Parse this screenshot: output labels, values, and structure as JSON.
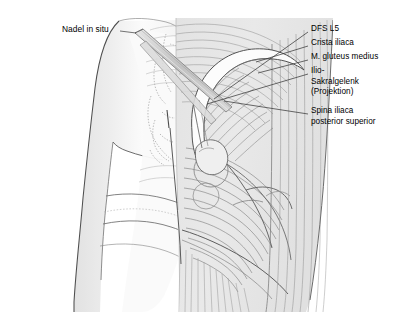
{
  "figure": {
    "background_color": "#ffffff"
  },
  "colors": {
    "skin_silhouette": "#ebebeb",
    "silhouette_outline": "#5a5a5a",
    "muscle_fill": "#e6e6e6",
    "muscle_fiber_line": "#8f8f8f",
    "muscle_outline": "#6e6e6e",
    "bone_white": "#fdfdfd",
    "bone_outline": "#4a4a4a",
    "needle_fill": "#cfcfcf",
    "needle_outline": "#7a7a7a",
    "leader_line": "#3a3a3a",
    "dashed_line": "#9a9a9a",
    "text": "#000000"
  },
  "labels": {
    "left": [
      {
        "name": "nadel-in-situ",
        "text": "Nadel in situ",
        "x": 62,
        "y": 24
      }
    ],
    "right": [
      {
        "name": "dfs-l5",
        "lines": [
          "DFS  L5"
        ],
        "x": 311,
        "y": 28,
        "leader": {
          "x1": 308,
          "y1": 32,
          "x2": 214,
          "y2": 99
        }
      },
      {
        "name": "crista-iliaca",
        "lines": [
          "Crista iliaca"
        ],
        "x": 311,
        "y": 42,
        "leader": {
          "x1": 308,
          "y1": 46,
          "x2": 255,
          "y2": 62
        }
      },
      {
        "name": "m-gluteus-medius",
        "lines": [
          "M. gluteus medius"
        ],
        "x": 311,
        "y": 56,
        "leader": {
          "x1": 308,
          "y1": 60,
          "x2": 258,
          "y2": 72
        }
      },
      {
        "name": "ilio-sakralgelenk-projektion",
        "lines": [
          "Ilio-",
          "Sakralgelenk",
          "(Projektion)"
        ],
        "x": 311,
        "y": 70,
        "leader": {
          "x1": 308,
          "y1": 74,
          "x2": 207,
          "y2": 103
        }
      },
      {
        "name": "spina-iliaca-posterior-superior",
        "lines": [
          "Spina iliaca",
          "posterior superior"
        ],
        "x": 311,
        "y": 110,
        "leader": {
          "x1": 308,
          "y1": 114,
          "x2": 222,
          "y2": 101
        }
      }
    ]
  }
}
